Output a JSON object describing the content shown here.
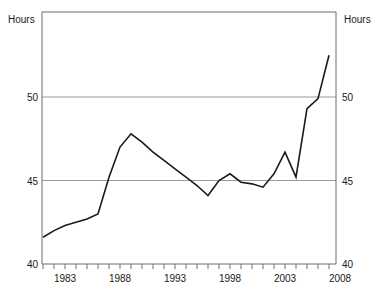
{
  "axes": {
    "left_unit_label": "Hours",
    "right_unit_label": "Hours",
    "y_ticks": [
      "40",
      "45",
      "50"
    ],
    "y_tick_40": "40",
    "y_tick_45": "45",
    "y_tick_50": "50",
    "y_tick_40_right": "40",
    "y_tick_45_right": "45",
    "y_tick_50_right": "50",
    "x_tick_1983": "1983",
    "x_tick_1988": "1988",
    "x_tick_1993": "1993",
    "x_tick_1998": "1998",
    "x_tick_2003": "2003",
    "x_tick_2008": "2008"
  },
  "colors": {
    "line": "#1a1a1a",
    "gridline": "#9a9a9a",
    "axis": "#6e6e6e",
    "background": "#ffffff",
    "text": "#1a1a1a"
  },
  "chart_data": {
    "type": "line",
    "title": "",
    "subtitle": "",
    "xlabel": "",
    "ylabel": "Hours",
    "y2label": "Hours",
    "ylim": [
      40,
      54
    ],
    "xlim": [
      1981,
      2008
    ],
    "grid": true,
    "gridlines_y": [
      45,
      50
    ],
    "legend": "none",
    "y_tick_values": [
      40,
      45,
      50
    ],
    "x_tick_labels": [
      1983,
      1988,
      1993,
      1998,
      2003,
      2008
    ],
    "x_minor_ticks_every": 1,
    "x": [
      1981,
      1982,
      1983,
      1984,
      1985,
      1986,
      1987,
      1988,
      1989,
      1990,
      1991,
      1992,
      1993,
      1994,
      1995,
      1996,
      1997,
      1998,
      1999,
      2000,
      2001,
      2002,
      2003,
      2004,
      2005,
      2006,
      2007
    ],
    "series": [
      {
        "name": "Hours",
        "values": [
          41.6,
          42.0,
          42.3,
          42.5,
          42.7,
          43.0,
          45.2,
          47.0,
          47.8,
          47.3,
          46.7,
          46.2,
          45.7,
          45.2,
          44.7,
          44.1,
          45.0,
          45.4,
          44.9,
          44.8,
          44.6,
          45.4,
          46.7,
          45.2,
          49.3,
          49.9,
          52.5
        ]
      }
    ]
  }
}
